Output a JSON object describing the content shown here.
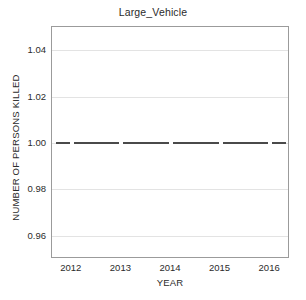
{
  "chart_data": {
    "type": "line",
    "title": "Large_Vehicle",
    "xlabel": "YEAR",
    "ylabel": "NUMBER OF PERSONS KILLED",
    "x": [
      2012,
      2013,
      2014,
      2015,
      2016
    ],
    "xtick_labels": [
      "2012",
      "2013",
      "2014",
      "2015",
      "2016"
    ],
    "values": [
      1.0,
      1.0,
      1.0,
      1.0,
      1.0
    ],
    "series": [
      {
        "name": "Large_Vehicle",
        "values": [
          1.0,
          1.0,
          1.0,
          1.0,
          1.0
        ]
      }
    ],
    "ylim": [
      0.95,
      1.05
    ],
    "xlim": [
      2011.6,
      2016.4
    ],
    "yticks": [
      0.96,
      0.98,
      1.0,
      1.02,
      1.04
    ],
    "ytick_labels": [
      "0.96",
      "0.98",
      "1.00",
      "1.02",
      "1.04"
    ],
    "grid": true,
    "grid_axis": "y",
    "legend": false,
    "legend_position": "none",
    "line_color": "#4a4a4a",
    "grid_color": "#e3e3e3",
    "frame_color": "#9b9b9b",
    "background_color": "#ffffff"
  }
}
